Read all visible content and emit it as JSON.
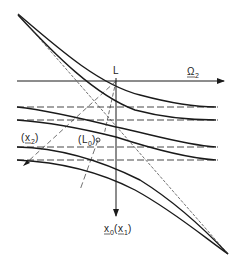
{
  "diagram": {
    "axes": {
      "horizontal_label": "Ω",
      "horizontal_label_sub": "2",
      "vertical_top_label": "L",
      "vertical_bottom_label_main": "x",
      "vertical_bottom_label_main_sub": "0",
      "vertical_bottom_label_alt": "x",
      "vertical_bottom_label_alt_sub": "1"
    },
    "annotations": {
      "x2_label": "x",
      "x2_sub": "2",
      "L0_label": "L",
      "L0_sub": "0"
    },
    "colors": {
      "line": "#1a1a1a",
      "background": "#ffffff"
    }
  }
}
